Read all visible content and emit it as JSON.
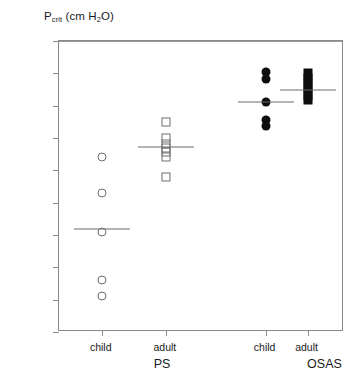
{
  "chart_data": {
    "type": "scatter",
    "title": "Pcrit (cm H2O)",
    "title_parts": {
      "main": "P",
      "sub": "crit",
      "units": " (cm H",
      "sub2": "2",
      "units_end": "O)"
    },
    "xlabel": "",
    "ylabel": "Pcrit (cm H2O)",
    "ylim": [
      -35,
      10
    ],
    "ytick_values": [
      10,
      5,
      0,
      -5,
      -10,
      -15,
      -20,
      -25,
      -30,
      -35
    ],
    "ytick_labels": [
      "10",
      "5",
      "0",
      "-5",
      "-10",
      "-15",
      "-20",
      "-25",
      "-30",
      "-35"
    ],
    "grid": false,
    "legend": "none",
    "zero_reference_line": 0,
    "major_groups": [
      {
        "label": "PS",
        "x_center": 0.365
      },
      {
        "label": "OSAS",
        "x_center": 0.935
      }
    ],
    "categories": [
      "child",
      "adult",
      "child",
      "adult"
    ],
    "groups": [
      {
        "name": "PS child",
        "group": "PS",
        "age": "child",
        "marker": "open-circle",
        "x_frac": 0.15,
        "values": [
          -8.0,
          -13.5,
          -19.5,
          -27.0,
          -29.5
        ],
        "mean": -19.0
      },
      {
        "name": "PS adult",
        "group": "PS",
        "age": "adult",
        "marker": "open-square",
        "x_frac": 0.375,
        "values": [
          -2.5,
          -5.0,
          -6.0,
          -6.6,
          -7.2,
          -8.0,
          -11.0
        ],
        "mean": -6.4
      },
      {
        "name": "OSAS child",
        "group": "OSAS",
        "age": "child",
        "marker": "filled-circle",
        "x_frac": 0.725,
        "values": [
          5.2,
          4.2,
          0.5,
          -2.2,
          -3.2
        ],
        "mean": 0.5
      },
      {
        "name": "OSAS adult",
        "group": "OSAS",
        "age": "adult",
        "marker": "filled-square",
        "x_frac": 0.872,
        "values": [
          5.0,
          4.3,
          3.6,
          2.9,
          2.2,
          1.5,
          0.8
        ],
        "mean": 2.5
      }
    ]
  },
  "colors": {
    "axis": "#8a8a8a",
    "text": "#1a1a1a",
    "open_marker_stroke": "#6e6e6e",
    "filled_marker": "#0d0d0d",
    "mean_bar": "#6a6a6a",
    "zero_line": "#9a9a9a",
    "background": "#ffffff"
  }
}
